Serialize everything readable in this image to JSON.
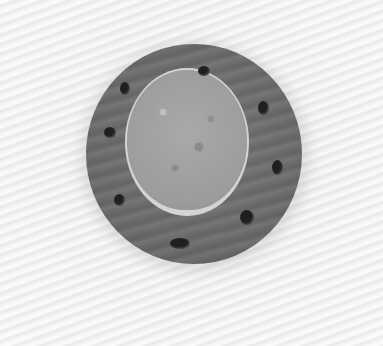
{
  "image": {
    "subject": "plated dessert",
    "description": "Round sponge/bread cake on a circular dark sauce disc with small black dots, on a white textured surface",
    "colors": {
      "background": "#f1f1f1",
      "sauce": "#6e6e6e",
      "sponge": "#a0a0a0",
      "dots": "#1f1f1f"
    },
    "dots": [
      {
        "x": 198,
        "y": 66,
        "w": 12,
        "h": 10
      },
      {
        "x": 120,
        "y": 82,
        "w": 10,
        "h": 13
      },
      {
        "x": 258,
        "y": 101,
        "w": 11,
        "h": 14
      },
      {
        "x": 104,
        "y": 127,
        "w": 12,
        "h": 11
      },
      {
        "x": 272,
        "y": 160,
        "w": 11,
        "h": 15
      },
      {
        "x": 114,
        "y": 194,
        "w": 11,
        "h": 12
      },
      {
        "x": 240,
        "y": 210,
        "w": 14,
        "h": 15
      },
      {
        "x": 170,
        "y": 238,
        "w": 20,
        "h": 11
      }
    ]
  }
}
